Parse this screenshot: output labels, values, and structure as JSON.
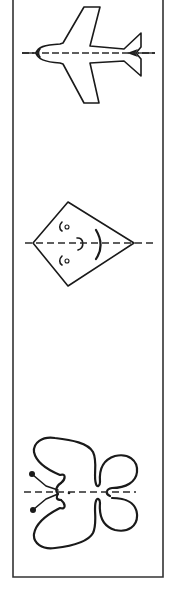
{
  "worksheet": {
    "description": "Symmetry worksheet with three figures, each bisected by a dashed line of symmetry",
    "colors": {
      "ink": "#1a1a1a",
      "frame": "#333333",
      "background": "#ffffff"
    },
    "figures": [
      {
        "id": "airplane",
        "label": "airplane",
        "symmetry_axis": "horizontal-dashed"
      },
      {
        "id": "kite",
        "label": "kite with face",
        "symmetry_axis": "horizontal-dashed"
      },
      {
        "id": "butterfly",
        "label": "butterfly",
        "symmetry_axis": "horizontal-dashed"
      }
    ]
  }
}
